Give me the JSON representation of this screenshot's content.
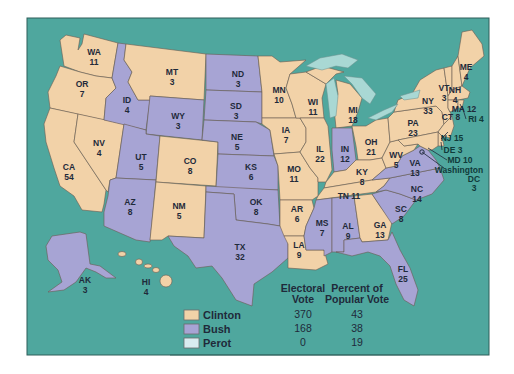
{
  "colors": {
    "clinton": "#f2d2a8",
    "bush": "#a7a4d4",
    "perot": "#d8ecf0",
    "water": "#4fa79e",
    "lakes": "#a9d8d4"
  },
  "states": {
    "WA": {
      "abbr": "WA",
      "votes": "11",
      "winner": "clinton"
    },
    "OR": {
      "abbr": "OR",
      "votes": "7",
      "winner": "clinton"
    },
    "CA": {
      "abbr": "CA",
      "votes": "54",
      "winner": "clinton"
    },
    "NV": {
      "abbr": "NV",
      "votes": "4",
      "winner": "clinton"
    },
    "ID": {
      "abbr": "ID",
      "votes": "4",
      "winner": "bush"
    },
    "MT": {
      "abbr": "MT",
      "votes": "3",
      "winner": "clinton"
    },
    "WY": {
      "abbr": "WY",
      "votes": "3",
      "winner": "bush"
    },
    "UT": {
      "abbr": "UT",
      "votes": "5",
      "winner": "bush"
    },
    "AZ": {
      "abbr": "AZ",
      "votes": "8",
      "winner": "bush"
    },
    "CO": {
      "abbr": "CO",
      "votes": "8",
      "winner": "clinton"
    },
    "NM": {
      "abbr": "NM",
      "votes": "5",
      "winner": "clinton"
    },
    "ND": {
      "abbr": "ND",
      "votes": "3",
      "winner": "bush"
    },
    "SD": {
      "abbr": "SD",
      "votes": "3",
      "winner": "bush"
    },
    "NE": {
      "abbr": "NE",
      "votes": "5",
      "winner": "bush"
    },
    "KS": {
      "abbr": "KS",
      "votes": "6",
      "winner": "bush"
    },
    "OK": {
      "abbr": "OK",
      "votes": "8",
      "winner": "bush"
    },
    "TX": {
      "abbr": "TX",
      "votes": "32",
      "winner": "bush"
    },
    "MN": {
      "abbr": "MN",
      "votes": "10",
      "winner": "clinton"
    },
    "IA": {
      "abbr": "IA",
      "votes": "7",
      "winner": "clinton"
    },
    "MO": {
      "abbr": "MO",
      "votes": "11",
      "winner": "clinton"
    },
    "AR": {
      "abbr": "AR",
      "votes": "6",
      "winner": "clinton"
    },
    "LA": {
      "abbr": "LA",
      "votes": "9",
      "winner": "clinton"
    },
    "WI": {
      "abbr": "WI",
      "votes": "11",
      "winner": "clinton"
    },
    "IL": {
      "abbr": "IL",
      "votes": "22",
      "winner": "clinton"
    },
    "MI": {
      "abbr": "MI",
      "votes": "18",
      "winner": "clinton"
    },
    "IN": {
      "abbr": "IN",
      "votes": "12",
      "winner": "bush"
    },
    "OH": {
      "abbr": "OH",
      "votes": "21",
      "winner": "clinton"
    },
    "KY": {
      "abbr": "KY",
      "votes": "8",
      "winner": "clinton"
    },
    "TN": {
      "abbr": "TN",
      "votes": "11",
      "winner": "clinton"
    },
    "MS": {
      "abbr": "MS",
      "votes": "7",
      "winner": "bush"
    },
    "AL": {
      "abbr": "AL",
      "votes": "9",
      "winner": "bush"
    },
    "GA": {
      "abbr": "GA",
      "votes": "13",
      "winner": "clinton"
    },
    "FL": {
      "abbr": "FL",
      "votes": "25",
      "winner": "bush"
    },
    "SC": {
      "abbr": "SC",
      "votes": "8",
      "winner": "bush"
    },
    "NC": {
      "abbr": "NC",
      "votes": "14",
      "winner": "bush"
    },
    "VA": {
      "abbr": "VA",
      "votes": "13",
      "winner": "bush"
    },
    "WV": {
      "abbr": "WV",
      "votes": "5",
      "winner": "clinton"
    },
    "PA": {
      "abbr": "PA",
      "votes": "23",
      "winner": "clinton"
    },
    "NY": {
      "abbr": "NY",
      "votes": "33",
      "winner": "clinton"
    },
    "VT": {
      "abbr": "VT",
      "votes": "3",
      "winner": "clinton"
    },
    "NH": {
      "abbr": "NH",
      "votes": "4",
      "winner": "clinton"
    },
    "ME": {
      "abbr": "ME",
      "votes": "4",
      "winner": "clinton"
    },
    "MA": {
      "abbr": "MA",
      "votes": "12",
      "winner": "clinton"
    },
    "CT": {
      "abbr": "CT",
      "votes": "8",
      "winner": "clinton"
    },
    "RI": {
      "abbr": "RI",
      "votes": "4",
      "winner": "clinton"
    },
    "NJ": {
      "abbr": "NJ",
      "votes": "15",
      "winner": "clinton"
    },
    "DE": {
      "abbr": "DE",
      "votes": "3",
      "winner": "clinton"
    },
    "MD": {
      "abbr": "MD",
      "votes": "10",
      "winner": "clinton"
    },
    "AK": {
      "abbr": "AK",
      "votes": "3",
      "winner": "bush"
    },
    "HI": {
      "abbr": "HI",
      "votes": "4",
      "winner": "clinton"
    }
  },
  "labels": {
    "ma_inline": "MA 12",
    "ct_inline": "CT 8",
    "ri_inline": "RI 4",
    "nj_inline": "NJ 15",
    "de_inline": "DE 3",
    "md_inline": "MD 10",
    "tn_inline": "TN 11",
    "dc_name": "Washington",
    "dc_abbr": "DC",
    "dc_votes": "3"
  },
  "legend": {
    "header_electoral_line1": "Electoral",
    "header_electoral_line2": "Vote",
    "header_popular_line1": "Percent of",
    "header_popular_line2": "Popular Vote",
    "rows": [
      {
        "candidate": "Clinton",
        "electoral": "370",
        "popular": "43"
      },
      {
        "candidate": "Bush",
        "electoral": "168",
        "popular": "38"
      },
      {
        "candidate": "Perot",
        "electoral": "0",
        "popular": "19"
      }
    ]
  }
}
